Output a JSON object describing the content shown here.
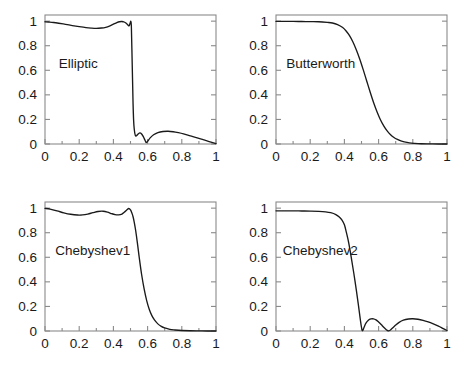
{
  "figure": {
    "background": "#ffffff",
    "frame_color": "#8a8a8a",
    "curve_color": "#1a1a1a",
    "text_color": "#1a1a1a"
  },
  "panels": [
    {
      "name": "elliptic",
      "label": "Elliptic",
      "label_x": 0.08,
      "label_y": 0.62
    },
    {
      "name": "butterworth",
      "label": "Butterworth",
      "label_x": 0.06,
      "label_y": 0.62
    },
    {
      "name": "chebyshev1",
      "label": "Chebyshev1",
      "label_x": 0.06,
      "label_y": 0.62
    },
    {
      "name": "chebyshev2",
      "label": "Chebyshev2",
      "label_x": 0.04,
      "label_y": 0.62
    }
  ],
  "chart_data": [
    {
      "type": "line",
      "title": "Elliptic",
      "xlabel": "",
      "ylabel": "",
      "xlim": [
        0,
        1
      ],
      "ylim": [
        0,
        1.05
      ],
      "xticks": [
        0,
        0.2,
        0.4,
        0.6,
        0.8,
        1
      ],
      "xticklabels": [
        "0",
        "0.2",
        "0.4",
        "0.6",
        "0.8",
        "1"
      ],
      "yticks": [
        0,
        0.2,
        0.4,
        0.6,
        0.8,
        1
      ],
      "yticklabels": [
        "0",
        "0.2",
        "0.4",
        "0.6",
        "0.8",
        "1"
      ],
      "grid": false,
      "legend": "none",
      "series": [
        {
          "name": "Elliptic magnitude response",
          "x": [
            0.0,
            0.02,
            0.05,
            0.08,
            0.12,
            0.16,
            0.2,
            0.24,
            0.27,
            0.3,
            0.33,
            0.355,
            0.38,
            0.4,
            0.42,
            0.435,
            0.45,
            0.463,
            0.475,
            0.485,
            0.492,
            0.498,
            0.502,
            0.505,
            0.508,
            0.512,
            0.515,
            0.518,
            0.522,
            0.528,
            0.535,
            0.545,
            0.555,
            0.565,
            0.575,
            0.585,
            0.592,
            0.6,
            0.615,
            0.635,
            0.66,
            0.69,
            0.72,
            0.75,
            0.78,
            0.81,
            0.85,
            0.89,
            0.93,
            0.96,
            0.98,
            1.0
          ],
          "y": [
            0.995,
            0.993,
            0.989,
            0.983,
            0.974,
            0.964,
            0.955,
            0.947,
            0.943,
            0.941,
            0.944,
            0.95,
            0.962,
            0.975,
            0.988,
            0.995,
            0.997,
            0.993,
            0.982,
            0.968,
            0.962,
            0.985,
            0.998,
            0.96,
            0.78,
            0.52,
            0.33,
            0.2,
            0.12,
            0.07,
            0.068,
            0.082,
            0.09,
            0.082,
            0.06,
            0.03,
            0.012,
            0.022,
            0.05,
            0.075,
            0.093,
            0.102,
            0.104,
            0.1,
            0.092,
            0.082,
            0.066,
            0.05,
            0.033,
            0.02,
            0.012,
            0.003
          ]
        }
      ]
    },
    {
      "type": "line",
      "title": "Butterworth",
      "xlabel": "",
      "ylabel": "",
      "xlim": [
        0,
        1
      ],
      "ylim": [
        0,
        1.05
      ],
      "xticks": [
        0,
        0.2,
        0.4,
        0.6,
        0.8,
        1
      ],
      "xticklabels": [
        "0",
        "0.2",
        "0.4",
        "0.6",
        "0.8",
        "1"
      ],
      "yticks": [
        0,
        0.2,
        0.4,
        0.6,
        0.8,
        1
      ],
      "yticklabels": [
        "0",
        "0.2",
        "0.4",
        "0.6",
        "0.8",
        "1"
      ],
      "grid": false,
      "legend": "none",
      "series": [
        {
          "name": "Butterworth magnitude response",
          "x": [
            0.0,
            0.05,
            0.1,
            0.15,
            0.2,
            0.25,
            0.3,
            0.33,
            0.36,
            0.39,
            0.41,
            0.43,
            0.45,
            0.47,
            0.49,
            0.51,
            0.53,
            0.55,
            0.57,
            0.59,
            0.61,
            0.63,
            0.65,
            0.67,
            0.69,
            0.71,
            0.73,
            0.75,
            0.78,
            0.81,
            0.85,
            0.9,
            0.95,
            1.0
          ],
          "y": [
            0.998,
            0.998,
            0.998,
            0.997,
            0.996,
            0.995,
            0.99,
            0.985,
            0.972,
            0.948,
            0.92,
            0.882,
            0.83,
            0.765,
            0.69,
            0.605,
            0.515,
            0.425,
            0.34,
            0.265,
            0.2,
            0.148,
            0.107,
            0.076,
            0.053,
            0.037,
            0.025,
            0.017,
            0.009,
            0.005,
            0.002,
            0.001,
            0.0,
            0.0
          ]
        }
      ]
    },
    {
      "type": "line",
      "title": "Chebyshev1",
      "xlabel": "",
      "ylabel": "",
      "xlim": [
        0,
        1
      ],
      "ylim": [
        0,
        1.05
      ],
      "xticks": [
        0,
        0.2,
        0.4,
        0.6,
        0.8,
        1
      ],
      "xticklabels": [
        "0",
        "0.2",
        "0.4",
        "0.6",
        "0.8",
        "1"
      ],
      "yticks": [
        0,
        0.2,
        0.4,
        0.6,
        0.8,
        1
      ],
      "yticklabels": [
        "0",
        "0.2",
        "0.4",
        "0.6",
        "0.8",
        "1"
      ],
      "grid": false,
      "legend": "none",
      "series": [
        {
          "name": "Chebyshev type I magnitude response",
          "x": [
            0.0,
            0.03,
            0.07,
            0.11,
            0.15,
            0.19,
            0.22,
            0.25,
            0.28,
            0.31,
            0.34,
            0.365,
            0.39,
            0.41,
            0.43,
            0.45,
            0.465,
            0.478,
            0.49,
            0.5,
            0.508,
            0.515,
            0.522,
            0.53,
            0.54,
            0.55,
            0.565,
            0.58,
            0.595,
            0.61,
            0.625,
            0.64,
            0.66,
            0.68,
            0.7,
            0.73,
            0.76,
            0.8,
            0.85,
            0.9,
            0.95,
            1.0
          ],
          "y": [
            0.998,
            0.992,
            0.978,
            0.962,
            0.95,
            0.944,
            0.945,
            0.952,
            0.963,
            0.973,
            0.975,
            0.968,
            0.955,
            0.947,
            0.945,
            0.952,
            0.968,
            0.985,
            0.997,
            0.985,
            0.96,
            0.93,
            0.885,
            0.82,
            0.72,
            0.61,
            0.46,
            0.34,
            0.245,
            0.175,
            0.125,
            0.09,
            0.058,
            0.038,
            0.025,
            0.013,
            0.008,
            0.004,
            0.002,
            0.001,
            0.0,
            0.0
          ]
        }
      ]
    },
    {
      "type": "line",
      "title": "Chebyshev2",
      "xlabel": "",
      "ylabel": "",
      "xlim": [
        0,
        1
      ],
      "ylim": [
        0,
        1.05
      ],
      "xticks": [
        0,
        0.2,
        0.4,
        0.6,
        0.8,
        1
      ],
      "xticklabels": [
        "0",
        "0.2",
        "0.4",
        "0.6",
        "0.8",
        "1"
      ],
      "yticks": [
        0,
        0.2,
        0.4,
        0.6,
        0.8,
        1
      ],
      "yticklabels": [
        "0",
        "0.2",
        "0.4",
        "0.6",
        "0.8",
        "1"
      ],
      "grid": false,
      "legend": "none",
      "series": [
        {
          "name": "Chebyshev type II magnitude response",
          "x": [
            0.0,
            0.05,
            0.1,
            0.15,
            0.2,
            0.25,
            0.29,
            0.32,
            0.35,
            0.37,
            0.385,
            0.4,
            0.412,
            0.425,
            0.44,
            0.455,
            0.47,
            0.482,
            0.492,
            0.5,
            0.507,
            0.515,
            0.525,
            0.54,
            0.555,
            0.57,
            0.585,
            0.6,
            0.615,
            0.63,
            0.645,
            0.655,
            0.665,
            0.68,
            0.7,
            0.72,
            0.745,
            0.775,
            0.8,
            0.83,
            0.86,
            0.89,
            0.92,
            0.95,
            0.975,
            1.0
          ],
          "y": [
            0.978,
            0.978,
            0.978,
            0.977,
            0.976,
            0.974,
            0.97,
            0.963,
            0.948,
            0.928,
            0.905,
            0.865,
            0.8,
            0.72,
            0.6,
            0.47,
            0.33,
            0.21,
            0.105,
            0.03,
            0.002,
            0.03,
            0.062,
            0.088,
            0.098,
            0.099,
            0.09,
            0.073,
            0.053,
            0.03,
            0.01,
            0.002,
            0.004,
            0.022,
            0.048,
            0.07,
            0.088,
            0.098,
            0.1,
            0.096,
            0.087,
            0.074,
            0.058,
            0.04,
            0.022,
            0.004
          ]
        }
      ]
    }
  ]
}
